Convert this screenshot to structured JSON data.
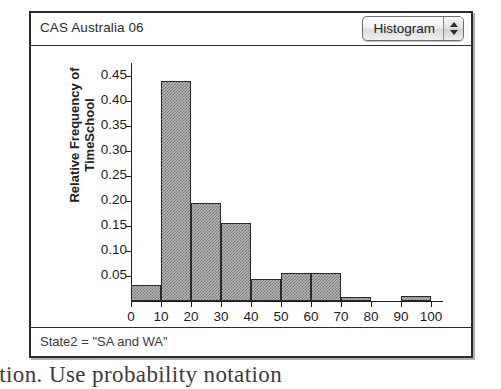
{
  "window": {
    "title": "CAS Australia 06",
    "plot_type_selector": {
      "value": "Histogram",
      "up_arrow": "arrow-up-icon",
      "down_arrow": "arrow-down-icon"
    },
    "status": "State2  =  \"SA and WA\""
  },
  "page": {
    "background_text": "ection. Use probability notation"
  },
  "colors": {
    "window_border": "#2b2b2b",
    "bar_fill": "#b4b4b4",
    "bar_border": "#2a2a2a",
    "axis": "#1d1d1d",
    "text": "#1d1d1d"
  },
  "chart_data": {
    "type": "bar",
    "title": "CAS Australia 06",
    "xlabel": "TimeSchool",
    "ylabel": "Relative Frequency of\nTimeSchool",
    "bin_width": 10,
    "xlim": [
      0,
      100
    ],
    "ylim": [
      0,
      0.47
    ],
    "grid": false,
    "legend": null,
    "xticks": [
      0,
      10,
      20,
      30,
      40,
      50,
      60,
      70,
      80,
      90,
      100
    ],
    "xtick_labels": [
      "0",
      "10",
      "20",
      "30",
      "40",
      "50",
      "60",
      "70",
      "80",
      "90",
      "100"
    ],
    "yticks": [
      0.05,
      0.1,
      0.15,
      0.2,
      0.25,
      0.3,
      0.35,
      0.4,
      0.45
    ],
    "ytick_labels": [
      "0.05",
      "0.10",
      "0.15",
      "0.20",
      "0.25",
      "0.30",
      "0.35",
      "0.40",
      "0.45"
    ],
    "bins": [
      {
        "from": 0,
        "to": 10,
        "value": 0.033
      },
      {
        "from": 10,
        "to": 20,
        "value": 0.44
      },
      {
        "from": 20,
        "to": 30,
        "value": 0.197
      },
      {
        "from": 30,
        "to": 40,
        "value": 0.157
      },
      {
        "from": 40,
        "to": 50,
        "value": 0.044
      },
      {
        "from": 50,
        "to": 60,
        "value": 0.057
      },
      {
        "from": 60,
        "to": 70,
        "value": 0.057
      },
      {
        "from": 70,
        "to": 80,
        "value": 0.008
      },
      {
        "from": 80,
        "to": 90,
        "value": 0.0
      },
      {
        "from": 90,
        "to": 100,
        "value": 0.01
      }
    ],
    "categories": [
      "0-10",
      "10-20",
      "20-30",
      "30-40",
      "40-50",
      "50-60",
      "60-70",
      "70-80",
      "80-90",
      "90-100"
    ],
    "values": [
      0.033,
      0.44,
      0.197,
      0.157,
      0.044,
      0.057,
      0.057,
      0.008,
      0.0,
      0.01
    ]
  }
}
